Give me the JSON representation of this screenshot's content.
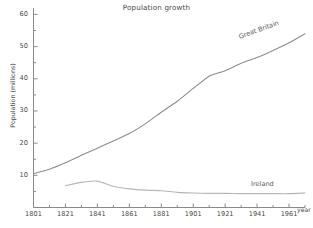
{
  "chart_data": {
    "type": "line",
    "title": "Population growth",
    "xlabel": "year",
    "ylabel": "Population (millions)",
    "xlim": [
      1801,
      1971
    ],
    "ylim": [
      0,
      62
    ],
    "grid": false,
    "legend_position": "inline-line-labels",
    "x_ticks_major": [
      1801,
      1821,
      1841,
      1861,
      1881,
      1901,
      1921,
      1941,
      1961
    ],
    "x_ticks_minor": [
      1811,
      1831,
      1851,
      1871,
      1891,
      1911,
      1931,
      1951,
      1971
    ],
    "y_ticks_major": [
      10,
      20,
      30,
      40,
      50,
      60
    ],
    "y_ticks_minor": [
      5,
      15,
      25,
      35,
      45,
      55
    ],
    "series": [
      {
        "name": "Great Britain",
        "color": "#8d8d8d",
        "x": [
          1801,
          1811,
          1821,
          1831,
          1841,
          1851,
          1861,
          1871,
          1881,
          1891,
          1901,
          1911,
          1921,
          1931,
          1941,
          1951,
          1961,
          1971
        ],
        "values": [
          10.5,
          11.9,
          13.9,
          16.2,
          18.4,
          20.7,
          23.0,
          26.0,
          29.6,
          33.0,
          37.0,
          40.8,
          42.5,
          44.8,
          46.6,
          48.8,
          51.2,
          54.0
        ]
      },
      {
        "name": "Ireland",
        "color": "#b6b6b6",
        "x": [
          1821,
          1831,
          1841,
          1851,
          1861,
          1871,
          1881,
          1891,
          1901,
          1911,
          1921,
          1931,
          1941,
          1951,
          1961,
          1971
        ],
        "values": [
          6.8,
          7.8,
          8.2,
          6.6,
          5.8,
          5.4,
          5.2,
          4.7,
          4.5,
          4.4,
          4.4,
          4.3,
          4.3,
          4.3,
          4.3,
          4.5
        ]
      }
    ]
  },
  "axis": {
    "y_tick_labels": [
      "60",
      "50",
      "40",
      "30",
      "20",
      "10"
    ],
    "x_tick_labels": [
      "1801",
      "1821",
      "1841",
      "1861",
      "1881",
      "1901",
      "1921",
      "1941",
      "1961"
    ],
    "x_axis_title": "year",
    "y_axis_title": "Population (millions)"
  },
  "labels": {
    "title": "Population growth",
    "great_britain": "Great Britain",
    "ireland": "Ireland"
  }
}
